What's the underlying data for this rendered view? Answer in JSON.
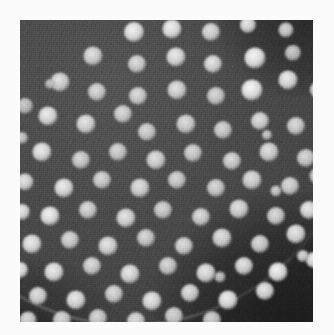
{
  "figure": {
    "modality": "grayscale micrograph",
    "caption": "",
    "background_color": "#ffffff",
    "plate": {
      "x": 20,
      "y": 20,
      "width": 293,
      "height": 302,
      "field_color": "#3c3c3c",
      "interior_color": "#555555",
      "exterior_color": "#1c1c1c",
      "rim_color": "#e0e0e0"
    },
    "specimen_disc": {
      "center_x": 108,
      "center_y": 76,
      "radius": 226,
      "note": "circular specimen edge crosses the lower-right and upper-right corners"
    }
  },
  "chart_data": {
    "type": "scatter",
    "xlabel": "",
    "ylabel": "",
    "xlim": [
      0,
      293
    ],
    "ylim": [
      0,
      302
    ],
    "grid": false,
    "legend": "none",
    "annotations": [
      "quasi-hexagonal array of bright circular spots",
      "dark granular background field",
      "curved specimen boundary in lower-right corner"
    ],
    "spot_count": 92,
    "spot_diameter_px": [
      13,
      22
    ],
    "lattice_spacing_px": 37,
    "spots": [
      {
        "x": 114,
        "y": 12,
        "r": 10.0,
        "b": 0.92
      },
      {
        "x": 152,
        "y": 9,
        "r": 9.5,
        "b": 0.93
      },
      {
        "x": 191,
        "y": 12,
        "r": 9.0,
        "b": 0.78
      },
      {
        "x": 228,
        "y": 5,
        "r": 8.0,
        "b": 0.84
      },
      {
        "x": 266,
        "y": 10,
        "r": 7.5,
        "b": 0.7
      },
      {
        "x": 73,
        "y": 36,
        "r": 9.5,
        "b": 0.8
      },
      {
        "x": 117,
        "y": 44,
        "r": 9.0,
        "b": 0.76
      },
      {
        "x": 156,
        "y": 37,
        "r": 9.5,
        "b": 0.86
      },
      {
        "x": 193,
        "y": 44,
        "r": 9.0,
        "b": 0.82
      },
      {
        "x": 235,
        "y": 38,
        "r": 10.5,
        "b": 0.95
      },
      {
        "x": 273,
        "y": 33,
        "r": 8.0,
        "b": 0.62
      },
      {
        "x": 40,
        "y": 62,
        "r": 9.5,
        "b": 0.8
      },
      {
        "x": 77,
        "y": 72,
        "r": 9.0,
        "b": 0.74
      },
      {
        "x": 118,
        "y": 76,
        "r": 9.0,
        "b": 0.75
      },
      {
        "x": 157,
        "y": 70,
        "r": 9.5,
        "b": 0.8
      },
      {
        "x": 196,
        "y": 76,
        "r": 9.0,
        "b": 0.72
      },
      {
        "x": 232,
        "y": 70,
        "r": 10.5,
        "b": 0.97
      },
      {
        "x": 268,
        "y": 60,
        "r": 9.5,
        "b": 0.88
      },
      {
        "x": 299,
        "y": 70,
        "r": 9.0,
        "b": 0.82
      },
      {
        "x": 5,
        "y": 86,
        "r": 8.0,
        "b": 0.6
      },
      {
        "x": 28,
        "y": 96,
        "r": 9.5,
        "b": 0.88
      },
      {
        "x": 66,
        "y": 104,
        "r": 9.5,
        "b": 0.82
      },
      {
        "x": 103,
        "y": 94,
        "r": 9.0,
        "b": 0.74
      },
      {
        "x": 127,
        "y": 112,
        "r": 9.0,
        "b": 0.72
      },
      {
        "x": 166,
        "y": 104,
        "r": 9.5,
        "b": 0.76
      },
      {
        "x": 203,
        "y": 110,
        "r": 9.0,
        "b": 0.7
      },
      {
        "x": 240,
        "y": 101,
        "r": 9.0,
        "b": 0.78
      },
      {
        "x": 276,
        "y": 106,
        "r": 9.0,
        "b": 0.74
      },
      {
        "x": 22,
        "y": 132,
        "r": 9.5,
        "b": 0.88
      },
      {
        "x": 61,
        "y": 140,
        "r": 9.0,
        "b": 0.72
      },
      {
        "x": 98,
        "y": 132,
        "r": 9.0,
        "b": 0.7
      },
      {
        "x": 136,
        "y": 140,
        "r": 9.5,
        "b": 0.78
      },
      {
        "x": 173,
        "y": 133,
        "r": 9.0,
        "b": 0.7
      },
      {
        "x": 212,
        "y": 141,
        "r": 9.0,
        "b": 0.74
      },
      {
        "x": 249,
        "y": 132,
        "r": 9.5,
        "b": 0.78
      },
      {
        "x": 286,
        "y": 138,
        "r": 9.0,
        "b": 0.72
      },
      {
        "x": 5,
        "y": 162,
        "r": 8.5,
        "b": 0.82
      },
      {
        "x": 44,
        "y": 168,
        "r": 9.5,
        "b": 0.88
      },
      {
        "x": 82,
        "y": 160,
        "r": 9.0,
        "b": 0.72
      },
      {
        "x": 120,
        "y": 168,
        "r": 9.5,
        "b": 0.8
      },
      {
        "x": 157,
        "y": 160,
        "r": 9.0,
        "b": 0.7
      },
      {
        "x": 196,
        "y": 168,
        "r": 9.0,
        "b": 0.72
      },
      {
        "x": 232,
        "y": 160,
        "r": 9.5,
        "b": 0.78
      },
      {
        "x": 270,
        "y": 166,
        "r": 9.0,
        "b": 0.74
      },
      {
        "x": 298,
        "y": 156,
        "r": 8.5,
        "b": 0.68
      },
      {
        "x": 2,
        "y": 192,
        "r": 8.0,
        "b": 0.86
      },
      {
        "x": 30,
        "y": 196,
        "r": 9.5,
        "b": 0.92
      },
      {
        "x": 68,
        "y": 190,
        "r": 9.0,
        "b": 0.74
      },
      {
        "x": 106,
        "y": 198,
        "r": 9.5,
        "b": 0.82
      },
      {
        "x": 143,
        "y": 190,
        "r": 9.0,
        "b": 0.7
      },
      {
        "x": 181,
        "y": 197,
        "r": 9.0,
        "b": 0.76
      },
      {
        "x": 219,
        "y": 189,
        "r": 9.5,
        "b": 0.8
      },
      {
        "x": 256,
        "y": 196,
        "r": 9.0,
        "b": 0.74
      },
      {
        "x": 289,
        "y": 190,
        "r": 9.0,
        "b": 0.86
      },
      {
        "x": 12,
        "y": 224,
        "r": 9.5,
        "b": 0.88
      },
      {
        "x": 50,
        "y": 220,
        "r": 9.0,
        "b": 0.74
      },
      {
        "x": 88,
        "y": 226,
        "r": 9.5,
        "b": 0.82
      },
      {
        "x": 126,
        "y": 218,
        "r": 9.0,
        "b": 0.72
      },
      {
        "x": 164,
        "y": 226,
        "r": 9.0,
        "b": 0.76
      },
      {
        "x": 202,
        "y": 218,
        "r": 9.5,
        "b": 0.8
      },
      {
        "x": 240,
        "y": 224,
        "r": 9.0,
        "b": 0.74
      },
      {
        "x": 276,
        "y": 214,
        "r": 9.5,
        "b": 0.84
      },
      {
        "x": 0,
        "y": 250,
        "r": 8.0,
        "b": 0.9
      },
      {
        "x": 34,
        "y": 252,
        "r": 9.5,
        "b": 0.88
      },
      {
        "x": 72,
        "y": 246,
        "r": 9.0,
        "b": 0.76
      },
      {
        "x": 110,
        "y": 254,
        "r": 9.5,
        "b": 0.84
      },
      {
        "x": 148,
        "y": 246,
        "r": 9.0,
        "b": 0.72
      },
      {
        "x": 186,
        "y": 253,
        "r": 9.5,
        "b": 0.84
      },
      {
        "x": 224,
        "y": 246,
        "r": 9.0,
        "b": 0.82
      },
      {
        "x": 258,
        "y": 252,
        "r": 9.5,
        "b": 0.92
      },
      {
        "x": 294,
        "y": 240,
        "r": 8.0,
        "b": 0.88
      },
      {
        "x": 18,
        "y": 276,
        "r": 9.0,
        "b": 0.8
      },
      {
        "x": 56,
        "y": 280,
        "r": 9.5,
        "b": 0.86
      },
      {
        "x": 94,
        "y": 274,
        "r": 9.0,
        "b": 0.76
      },
      {
        "x": 132,
        "y": 281,
        "r": 9.5,
        "b": 0.86
      },
      {
        "x": 170,
        "y": 273,
        "r": 9.0,
        "b": 0.8
      },
      {
        "x": 208,
        "y": 280,
        "r": 9.5,
        "b": 0.9
      },
      {
        "x": 245,
        "y": 271,
        "r": 9.0,
        "b": 0.84
      },
      {
        "x": 8,
        "y": 300,
        "r": 8.5,
        "b": 0.74
      },
      {
        "x": 42,
        "y": 300,
        "r": 9.0,
        "b": 0.72
      },
      {
        "x": 78,
        "y": 298,
        "r": 9.0,
        "b": 0.7
      },
      {
        "x": 116,
        "y": 301,
        "r": 9.0,
        "b": 0.74
      },
      {
        "x": 154,
        "y": 296,
        "r": 9.0,
        "b": 0.7
      },
      {
        "x": 192,
        "y": 300,
        "r": 9.0,
        "b": 0.68
      },
      {
        "x": 247,
        "y": 115,
        "r": 5.0,
        "b": 0.6
      },
      {
        "x": 256,
        "y": 171,
        "r": 5.5,
        "b": 0.66
      },
      {
        "x": 283,
        "y": 236,
        "r": 6.0,
        "b": 0.72
      },
      {
        "x": 30,
        "y": 64,
        "r": 5.0,
        "b": 0.52
      },
      {
        "x": 2,
        "y": 118,
        "r": 6.0,
        "b": 0.62
      },
      {
        "x": 200,
        "y": 257,
        "r": 5.5,
        "b": 0.58
      },
      {
        "x": 150,
        "y": 311,
        "r": 6.0,
        "b": 0.55
      },
      {
        "x": 228,
        "y": 309,
        "r": 5.5,
        "b": 0.58
      }
    ]
  }
}
